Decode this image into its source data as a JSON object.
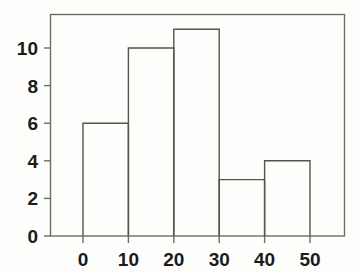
{
  "chart_data": {
    "type": "bar",
    "title": "",
    "subtitle": "",
    "xlabel": "",
    "ylabel": "",
    "categories": [
      "0-10",
      "10-20",
      "20-30",
      "30-40",
      "40-50"
    ],
    "bin_edges": [
      0,
      10,
      20,
      30,
      40,
      50
    ],
    "values": [
      6,
      10,
      11,
      3,
      4
    ],
    "xlim": [
      -8,
      58
    ],
    "ylim": [
      0,
      11.8
    ],
    "xticks": [
      0,
      10,
      20,
      30,
      40,
      50
    ],
    "xtick_labels": [
      "0",
      "10",
      "20",
      "30",
      "40",
      "50"
    ],
    "yticks": [
      0,
      2,
      4,
      6,
      8,
      10
    ],
    "ytick_labels": [
      "0",
      "2",
      "4",
      "6",
      "8",
      "10"
    ],
    "grid": false,
    "legend": null,
    "bar_fill": "none",
    "bar_stroke": "#55554e",
    "axis_color": "#6e6e66",
    "background": "#fdfdfb",
    "text_color": "#1b1b1b",
    "annotations": []
  }
}
